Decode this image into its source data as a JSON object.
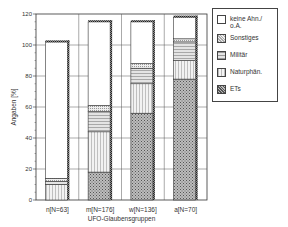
{
  "chart_data": {
    "type": "bar",
    "stacked": true,
    "title": "",
    "xlabel": "UFO-Glaubensgruppen",
    "ylabel": "Angaben [%]",
    "ylim": [
      0,
      120
    ],
    "yticks": [
      0,
      20,
      40,
      60,
      80,
      100,
      120
    ],
    "grid": true,
    "legend_position": "right",
    "categories": [
      "n[N=63]",
      "m[N=176]",
      "w[N=136]",
      "a[N=70]"
    ],
    "series": [
      {
        "name": "ETs",
        "pattern": "crosshatch-dark",
        "values": [
          0,
          18,
          56,
          78
        ]
      },
      {
        "name": "Naturphän.",
        "pattern": "vertical-dots",
        "values": [
          10,
          26,
          19,
          12
        ]
      },
      {
        "name": "Militär",
        "pattern": "horizontal-dots",
        "values": [
          2,
          13,
          10,
          12
        ]
      },
      {
        "name": "Sonstiges",
        "pattern": "dots-light",
        "values": [
          2,
          4,
          3,
          2
        ]
      },
      {
        "name": "keine Ahn./ o.A.",
        "pattern": "white",
        "values": [
          88,
          54,
          27,
          14
        ]
      }
    ],
    "totals": [
      102,
      115,
      115,
      118
    ]
  },
  "legend": {
    "items": [
      {
        "label_line1": "keine Ahn./",
        "label_line2": "o.A."
      },
      {
        "label_line1": "Sonstiges",
        "label_line2": ""
      },
      {
        "label_line1": "Militär",
        "label_line2": ""
      },
      {
        "label_line1": "Naturphän.",
        "label_line2": ""
      },
      {
        "label_line1": "ETs",
        "label_line2": ""
      }
    ]
  }
}
